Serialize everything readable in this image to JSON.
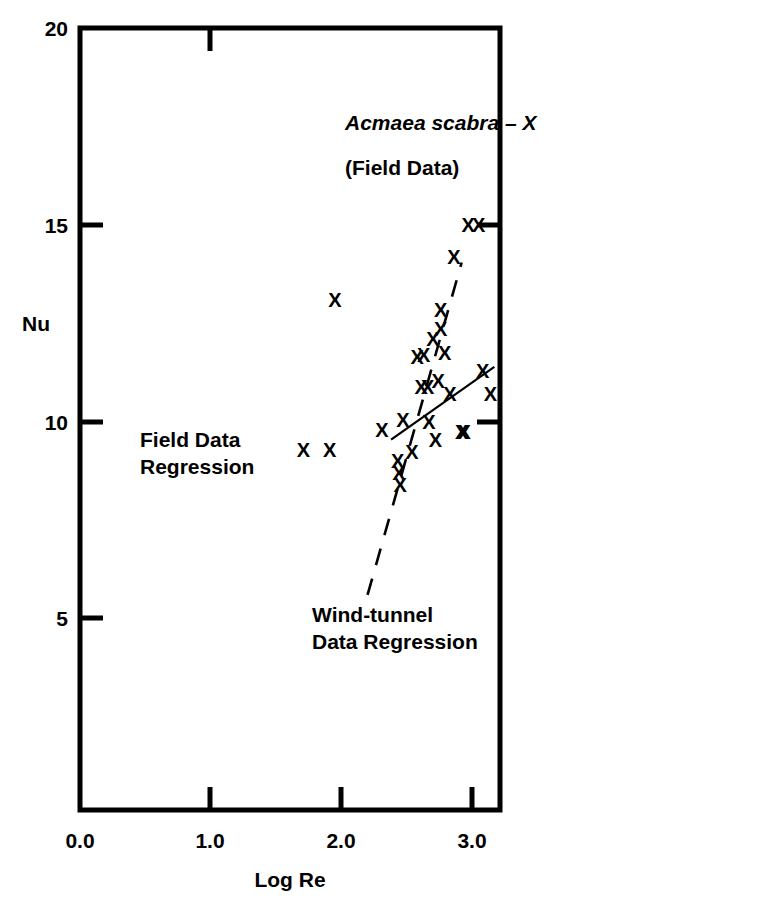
{
  "figure": {
    "background_color": "#ffffff",
    "ink_color": "#000000"
  },
  "annotations": {
    "species_label": "Acmaea scabra – X",
    "species_sub_label": "(Field Data)",
    "field_regression_line1": "Field Data",
    "field_regression_line2": "Regression",
    "wind_regression_line1": "Wind-tunnel",
    "wind_regression_line2": "Data Regression"
  },
  "axes": {
    "y_title": "Nu",
    "x_title": "Log Re",
    "y_ticks": [
      "20",
      "15",
      "10",
      "5"
    ],
    "x_ticks": [
      "0.0",
      "1.0",
      "2.0",
      "3.0"
    ]
  },
  "chart_data": {
    "type": "scatter",
    "title": "Acmaea scabra – X (Field Data)",
    "xlabel": "Log Re",
    "ylabel": "Nu",
    "xlim": [
      0.0,
      3.22
    ],
    "ylim": [
      1.55,
      20.0
    ],
    "x_ticks": [
      0.0,
      1.0,
      2.0,
      3.0
    ],
    "y_ticks": [
      5,
      10,
      15,
      20
    ],
    "grid": false,
    "legend": "none",
    "marker": "X",
    "series": [
      {
        "name": "Acmaea scabra field data",
        "marker": "X",
        "points": [
          [
            1.95,
            13.1
          ],
          [
            1.71,
            9.3
          ],
          [
            1.91,
            9.3
          ],
          [
            2.31,
            9.8
          ],
          [
            2.43,
            9.0
          ],
          [
            2.44,
            8.7
          ],
          [
            2.45,
            8.4
          ],
          [
            2.47,
            10.05
          ],
          [
            2.54,
            9.25
          ],
          [
            2.58,
            11.65
          ],
          [
            2.61,
            10.9
          ],
          [
            2.63,
            11.7
          ],
          [
            2.66,
            10.9
          ],
          [
            2.67,
            10.0
          ],
          [
            2.7,
            12.1
          ],
          [
            2.72,
            9.55
          ],
          [
            2.74,
            11.05
          ],
          [
            2.76,
            12.85
          ],
          [
            2.76,
            12.35
          ],
          [
            2.79,
            11.75
          ],
          [
            2.83,
            10.7
          ],
          [
            2.86,
            14.2
          ],
          [
            2.92,
            9.75
          ],
          [
            2.94,
            9.75
          ],
          [
            2.97,
            15.0
          ],
          [
            3.05,
            15.0
          ],
          [
            3.08,
            11.3
          ],
          [
            3.14,
            10.7
          ]
        ]
      }
    ],
    "trend_lines": [
      {
        "name": "Field Data Regression",
        "style": "solid",
        "x_start": 2.38,
        "y_start": 9.55,
        "x_end": 3.17,
        "y_end": 11.4
      },
      {
        "name": "Wind-tunnel Data Regression",
        "style": "dashed",
        "x_start": 2.2,
        "y_start": 5.61,
        "x_end": 2.92,
        "y_end": 14.05
      }
    ]
  }
}
